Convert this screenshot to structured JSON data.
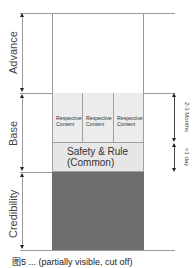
{
  "diagram": {
    "left_axis": {
      "sections": [
        {
          "label": "Advance"
        },
        {
          "label": "Base"
        },
        {
          "label": "Credibility"
        }
      ]
    },
    "base": {
      "respective_boxes": [
        {
          "label": "Respective Content"
        },
        {
          "label": "Respective Content"
        },
        {
          "label": "Respective Content"
        }
      ],
      "common_box": {
        "line1": "Safety & Rule",
        "line2": "(Common)"
      }
    },
    "right_axis": {
      "durations": [
        {
          "label": "2-3 Months"
        },
        {
          "label": "<1 day"
        }
      ]
    },
    "colors": {
      "respective_fill": "#ececec",
      "common_fill": "#e6e6e6",
      "credibility_fill": "#6e6e6e",
      "lines": "#9a9a9a"
    },
    "caption": "图5 ... (partially visible, cut off)"
  }
}
